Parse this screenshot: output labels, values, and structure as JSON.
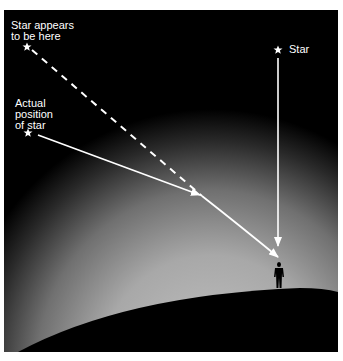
{
  "diagram": {
    "type": "atmospheric-refraction",
    "labels": {
      "apparent_star": "Star appears\nto be here",
      "actual_star": "Actual\nposition\nof star",
      "overhead_star": "Star"
    },
    "colors": {
      "sky": "#000000",
      "atmosphere_glow": "#b4b4b4",
      "ray": "#ffffff",
      "earth": "#000000",
      "frame": "#ffffff"
    },
    "elements": [
      {
        "id": "apparent-star",
        "icon": "star-icon",
        "x": 27,
        "y": 47
      },
      {
        "id": "actual-star",
        "icon": "star-icon",
        "x": 28,
        "y": 133
      },
      {
        "id": "overhead-star",
        "icon": "star-icon",
        "x": 278,
        "y": 50
      },
      {
        "id": "observer",
        "icon": "person-silhouette-icon",
        "x": 279,
        "y": 275
      }
    ]
  }
}
